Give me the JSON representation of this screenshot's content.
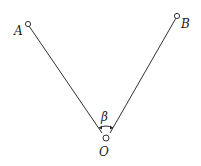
{
  "diagram": {
    "points": {
      "A": {
        "label": "A",
        "x": 28,
        "y": 24
      },
      "B": {
        "label": "B",
        "x": 177,
        "y": 16
      },
      "O": {
        "label": "O",
        "x": 106,
        "y": 138
      }
    },
    "angle": {
      "label": "β",
      "vertex": "O",
      "between": [
        "A",
        "B"
      ]
    },
    "line_color": "#333333"
  }
}
